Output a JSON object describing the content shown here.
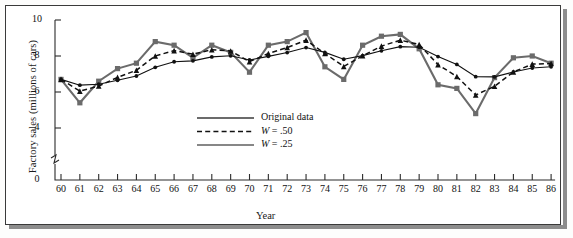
{
  "figure": {
    "ylabel": "Factory sales (millions of cars)",
    "xlabel": "Year"
  },
  "legend": {
    "items": [
      {
        "label": "Original data",
        "style": "solid-thick",
        "color": "#6b6b6b"
      },
      {
        "label": "W = .50",
        "style": "dashed",
        "color": "#111111"
      },
      {
        "label": "W = .25",
        "style": "solid-thin",
        "color": "#111111"
      }
    ]
  },
  "axes": {
    "y_ticks": [
      "0",
      "4",
      "6",
      "8",
      "10"
    ],
    "y_tick_values": [
      0,
      4,
      6,
      8,
      10
    ],
    "y_break_below": 4,
    "x_ticks": [
      "60",
      "61",
      "62",
      "63",
      "64",
      "65",
      "66",
      "67",
      "68",
      "69",
      "70",
      "71",
      "72",
      "73",
      "74",
      "75",
      "76",
      "77",
      "78",
      "79",
      "80",
      "81",
      "82",
      "83",
      "84",
      "85",
      "86"
    ]
  },
  "chart_data": {
    "type": "line",
    "title": "",
    "xlabel": "Year",
    "ylabel": "Factory sales (millions of cars)",
    "xlim": [
      60,
      86
    ],
    "ylim": [
      4,
      10
    ],
    "ylim_displayed": [
      0,
      10
    ],
    "y_axis_break": true,
    "grid": false,
    "legend_position": "inside-center-right",
    "x": [
      1960,
      1961,
      1962,
      1963,
      1964,
      1965,
      1966,
      1967,
      1968,
      1969,
      1970,
      1971,
      1972,
      1973,
      1974,
      1975,
      1976,
      1977,
      1978,
      1979,
      1980,
      1981,
      1982,
      1983,
      1984,
      1985,
      1986
    ],
    "categories": [
      "60",
      "61",
      "62",
      "63",
      "64",
      "65",
      "66",
      "67",
      "68",
      "69",
      "70",
      "71",
      "72",
      "73",
      "74",
      "75",
      "76",
      "77",
      "78",
      "79",
      "80",
      "81",
      "82",
      "83",
      "84",
      "85",
      "86"
    ],
    "series": [
      {
        "name": "Original data",
        "style": "solid-thick",
        "color": "#6b6b6b",
        "values": [
          6.7,
          5.4,
          6.6,
          7.3,
          7.6,
          8.8,
          8.6,
          7.9,
          8.6,
          8.2,
          7.1,
          8.6,
          8.8,
          9.3,
          7.4,
          6.7,
          8.6,
          9.1,
          9.2,
          8.4,
          6.4,
          6.2,
          4.8,
          6.8,
          7.9,
          8.0,
          7.6
        ]
      },
      {
        "name": "W = .50",
        "style": "dashed",
        "color": "#111111",
        "values": [
          6.7,
          6.05,
          6.33,
          6.81,
          7.21,
          8.0,
          8.3,
          8.1,
          8.35,
          8.28,
          7.69,
          8.14,
          8.47,
          8.88,
          8.14,
          7.42,
          8.01,
          8.55,
          8.88,
          8.64,
          7.52,
          6.86,
          5.83,
          6.32,
          7.11,
          7.55,
          7.58
        ]
      },
      {
        "name": "W = .25",
        "style": "solid-thin",
        "color": "#111111",
        "values": [
          6.7,
          6.38,
          6.43,
          6.65,
          6.89,
          7.37,
          7.68,
          7.73,
          7.95,
          8.01,
          7.78,
          7.98,
          8.19,
          8.47,
          8.2,
          7.82,
          8.02,
          8.29,
          8.52,
          8.49,
          7.97,
          7.53,
          6.85,
          6.84,
          7.11,
          7.33,
          7.4
        ]
      }
    ]
  }
}
